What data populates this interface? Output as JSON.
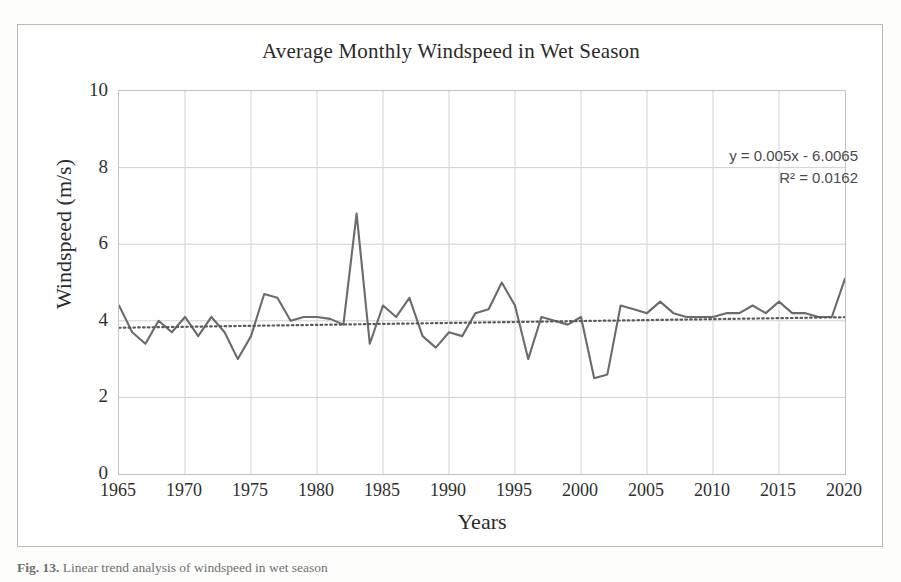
{
  "figure": {
    "caption_prefix": "Fig. 13.",
    "caption_text": "Linear trend analysis of windspeed in wet season"
  },
  "chart_data": {
    "type": "line",
    "title": "Average Monthly Windspeed in Wet Season",
    "xlabel": "Years",
    "ylabel": "Windspeed (m/s)",
    "xlim": [
      1965,
      2020
    ],
    "ylim": [
      0,
      10
    ],
    "grid": true,
    "legend": "none",
    "series_name": "Average monthly windspeed",
    "series_color": "#6b6b6b",
    "trendline_color": "#5a5a5a",
    "trendline_style": "dotted",
    "annotations": {
      "equation": "y = 0.005x - 6.0065",
      "r_squared_label": "R² = 0.0162",
      "r_squared_value": 0.0162,
      "slope": 0.005,
      "intercept": -6.0065
    },
    "yticks": [
      0,
      2,
      4,
      6,
      8,
      10
    ],
    "xticks": [
      1965,
      1970,
      1975,
      1980,
      1985,
      1990,
      1995,
      2000,
      2005,
      2010,
      2015,
      2020
    ],
    "x": [
      1965,
      1966,
      1967,
      1968,
      1969,
      1970,
      1971,
      1972,
      1973,
      1974,
      1975,
      1976,
      1977,
      1978,
      1979,
      1980,
      1981,
      1982,
      1983,
      1984,
      1985,
      1986,
      1987,
      1988,
      1989,
      1990,
      1991,
      1992,
      1993,
      1994,
      1995,
      1996,
      1997,
      1998,
      1999,
      2000,
      2001,
      2002,
      2003,
      2004,
      2005,
      2006,
      2007,
      2008,
      2009,
      2010,
      2011,
      2012,
      2013,
      2014,
      2015,
      2016,
      2017,
      2018,
      2019,
      2020
    ],
    "values": [
      4.4,
      3.7,
      3.4,
      4.0,
      3.7,
      4.1,
      3.6,
      4.1,
      3.7,
      3.0,
      3.6,
      4.7,
      4.6,
      4.0,
      4.1,
      4.1,
      4.05,
      3.9,
      6.8,
      3.4,
      4.4,
      4.1,
      4.6,
      3.6,
      3.3,
      3.7,
      3.6,
      4.2,
      4.3,
      5.0,
      4.4,
      3.0,
      4.1,
      4.0,
      3.9,
      4.1,
      2.5,
      2.6,
      4.4,
      4.3,
      4.2,
      4.5,
      4.2,
      4.1,
      4.1,
      4.1,
      4.2,
      4.2,
      4.4,
      4.2,
      4.5,
      4.2,
      4.2,
      4.1,
      4.1,
      5.1
    ]
  }
}
